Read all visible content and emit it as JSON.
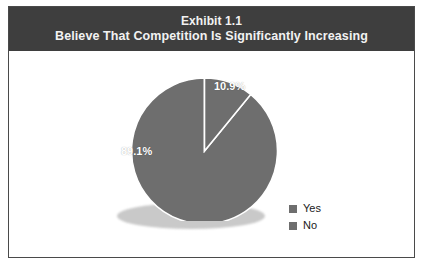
{
  "exhibit": {
    "title_line_1": "Exhibit 1.1",
    "title_line_2": "Believe That Competition Is Significantly Increasing"
  },
  "legend": {
    "items": [
      {
        "label": "Yes",
        "color": "#6e6e6e"
      },
      {
        "label": "No",
        "color": "#6e6e6e"
      }
    ]
  },
  "labels": {
    "yes_pct": "89.1%",
    "no_pct": "10.9%"
  },
  "colors": {
    "title_bar": "#3e3e3e",
    "frame_border": "#4a4a4a",
    "slice_fill": "#6e6e6e",
    "slice_separator": "#ffffff",
    "shadow": "#c9c9c9",
    "label_text": "#ffffff",
    "background": "#ffffff"
  },
  "chart_data": {
    "type": "pie",
    "title": "Exhibit 1.1 Believe That Competition Is Significantly Increasing",
    "categories": [
      "Yes",
      "No"
    ],
    "values": [
      89.1,
      10.9
    ],
    "value_labels": [
      "89.1%",
      "10.9%"
    ],
    "colors": [
      "#6e6e6e",
      "#6e6e6e"
    ],
    "start_angle_deg": 0,
    "direction": "clockwise",
    "legend_position": "right",
    "grid": false,
    "xlabel": "",
    "ylabel": ""
  }
}
